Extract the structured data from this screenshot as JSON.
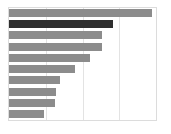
{
  "chart_data": {
    "type": "bar",
    "orientation": "horizontal",
    "title": "",
    "subtitle": "",
    "xlabel": "",
    "ylabel": "",
    "xlim": [
      0,
      100
    ],
    "grid": true,
    "grid_axis": "x",
    "legend": false,
    "legend_position": "none",
    "categories": [
      "Bar 1",
      "Bar 2",
      "Bar 3",
      "Bar 4",
      "Bar 5",
      "Bar 6",
      "Bar 7",
      "Bar 8",
      "Bar 9",
      "Bar 10"
    ],
    "values": [
      97,
      71,
      63,
      63,
      55,
      45,
      35,
      32,
      31,
      24
    ],
    "tick_labels": [],
    "annotations": [],
    "bars": [
      {
        "label": "",
        "value": 97,
        "color": "#8c8c8c",
        "highlight": false
      },
      {
        "label": "",
        "value": 71,
        "color": "#2f2f2f",
        "highlight": true
      },
      {
        "label": "",
        "value": 63,
        "color": "#8c8c8c",
        "highlight": false
      },
      {
        "label": "",
        "value": 63,
        "color": "#8c8c8c",
        "highlight": false
      },
      {
        "label": "",
        "value": 55,
        "color": "#8c8c8c",
        "highlight": false
      },
      {
        "label": "",
        "value": 45,
        "color": "#8c8c8c",
        "highlight": false
      },
      {
        "label": "",
        "value": 35,
        "color": "#8c8c8c",
        "highlight": false
      },
      {
        "label": "",
        "value": 32,
        "color": "#8c8c8c",
        "highlight": false
      },
      {
        "label": "",
        "value": 31,
        "color": "#8c8c8c",
        "highlight": false
      },
      {
        "label": "",
        "value": 24,
        "color": "#8c8c8c",
        "highlight": false
      }
    ],
    "gridline_positions": [
      25,
      50,
      75
    ]
  },
  "colors": {
    "bar_default": "#8c8c8c",
    "bar_highlight": "#2f2f2f",
    "panel_background": "#ffffff",
    "panel_border": "#dcdcdc",
    "gridline": "#e3e3e3",
    "page_background": "#ffffff"
  }
}
